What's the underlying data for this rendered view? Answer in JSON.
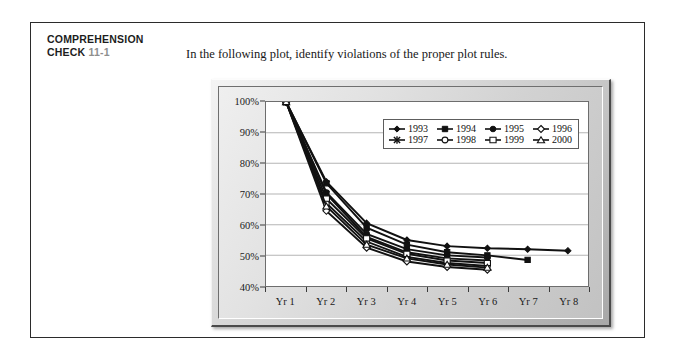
{
  "header": {
    "title_line1": "COMPREHENSION",
    "title_line2": "CHECK",
    "number": "11-1",
    "prompt": "In the following plot, identify violations of the proper plot rules."
  },
  "chart_data": {
    "type": "line",
    "title": "",
    "xlabel": "",
    "ylabel": "",
    "categories": [
      "Yr 1",
      "Yr 2",
      "Yr 3",
      "Yr 4",
      "Yr 5",
      "Yr 6",
      "Yr 7",
      "Yr 8"
    ],
    "ylim": [
      40,
      100
    ],
    "ytick_labels": [
      "100%",
      "90%",
      "80%",
      "70%",
      "60%",
      "50%",
      "40%"
    ],
    "ytick_values": [
      100,
      90,
      80,
      70,
      60,
      50,
      40
    ],
    "grid": "horizontal",
    "legend_position": "inside-top-right",
    "series": [
      {
        "name": "1993",
        "marker": "filled-diamond",
        "values": [
          100,
          74.0,
          60.5,
          55.0,
          53.0,
          52.3,
          52.0,
          51.5
        ]
      },
      {
        "name": "1994",
        "marker": "filled-square",
        "values": [
          100,
          73.5,
          59.0,
          53.5,
          51.0,
          50.0,
          48.5,
          null
        ]
      },
      {
        "name": "1995",
        "marker": "filled-circle",
        "values": [
          100,
          70.5,
          57.0,
          52.0,
          50.0,
          49.3,
          null,
          null
        ]
      },
      {
        "name": "1996",
        "marker": "open-diamond",
        "values": [
          100,
          64.5,
          52.5,
          48.0,
          46.2,
          45.3,
          null,
          null
        ]
      },
      {
        "name": "1997",
        "marker": "star-cross",
        "values": [
          100,
          70.0,
          56.0,
          51.0,
          49.0,
          48.3,
          null,
          null
        ]
      },
      {
        "name": "1998",
        "marker": "open-circle",
        "values": [
          100,
          67.0,
          54.5,
          49.5,
          47.5,
          46.5,
          null,
          null
        ]
      },
      {
        "name": "1999",
        "marker": "open-square",
        "values": [
          100,
          68.5,
          55.5,
          50.5,
          48.3,
          47.5,
          null,
          null
        ]
      },
      {
        "name": "2000",
        "marker": "open-triangle",
        "values": [
          100,
          66.0,
          53.5,
          49.0,
          47.0,
          46.0,
          null,
          null
        ]
      }
    ]
  },
  "colors": {
    "ink": "#111111",
    "number_gray": "#8e8e8e",
    "frame_gray": "#c2c2c2",
    "grid": "#b4b4b4",
    "plot_bg": "#ffffff"
  }
}
